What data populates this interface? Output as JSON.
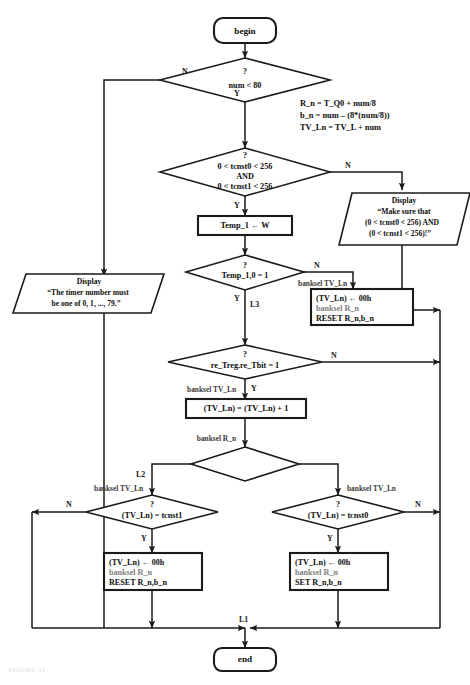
{
  "figure": {
    "caption": "FIGURE 11",
    "type": "flowchart"
  },
  "terminals": {
    "begin": "begin",
    "end": "end"
  },
  "decisions": {
    "num_range": {
      "question": "?",
      "text": "num  < 80",
      "yes": "Y",
      "no": "N"
    },
    "tcnst_range": {
      "question": "?",
      "line1": "0 <  tcnst0 < 256",
      "line2": "AND",
      "line3": "0 <  tcnst1 < 256",
      "yes": "Y",
      "no": "N"
    },
    "temp_bit": {
      "question": "?",
      "text": "Temp_1,0 = 1",
      "yes": "Y",
      "no": "N"
    },
    "re_treg": {
      "question": "?",
      "text": "re_Treg.re_Tbit = 1",
      "yes": "Y",
      "no": "N"
    },
    "rn_bn_zero": {
      "question": "?",
      "text": "R_n.b_n = 0",
      "yes": "Y",
      "no": "N"
    },
    "tvln_eq_tcnst1": {
      "question": "?",
      "text": "(TV_Ln) = tcnst1",
      "yes": "Y",
      "no": "N"
    },
    "tvln_eq_tcnst0": {
      "question": "?",
      "text": "(TV_Ln) = tcnst0",
      "yes": "Y",
      "no": "N"
    }
  },
  "processes": {
    "temp_load": "Temp_1 ← W",
    "tvln_inc": "(TV_Ln) = (TV_Ln) + 1",
    "reset_top": {
      "line1": "(TV_Ln) ← 00h",
      "line2": "banksel R_n",
      "line3": "RESET R_n,b_n"
    },
    "reset_left": {
      "line1": "(TV_Ln) ← 00h",
      "line2": "banksel R_n",
      "line3": "RESET R_n,b_n"
    },
    "set_right": {
      "line1": "(TV_Ln) ← 00h",
      "line2": "banksel R_n",
      "line3": "SET R_n,b_n"
    }
  },
  "displays": {
    "timer_number": {
      "line1": "Display",
      "line2": "“The timer number must",
      "line3": "be one of 0, 1, ..., 79.”"
    },
    "make_sure": {
      "line1": "Display",
      "line2": "“Make sure that",
      "line3": "(0 < tcnst0 < 256) AND",
      "line4": "(0 < tcnst1 < 256)!”"
    }
  },
  "annotations": {
    "formula": {
      "line1": "R_n = T_Q0 + num/8",
      "line2": "b_n =  num – (8*(num/8))",
      "line3": "TV_Ln =  TV_L + num"
    },
    "banksel_tvln": "banksel TV_Ln",
    "banksel_rn": "banksel R_n"
  },
  "labels": {
    "l1": "L1",
    "l2": "L2",
    "l3": "L3"
  },
  "colors": {
    "stroke": "#1a1a1a",
    "text": "#0d0d0d",
    "dim_text": "#7d7d7d",
    "background": "#ffffff"
  }
}
